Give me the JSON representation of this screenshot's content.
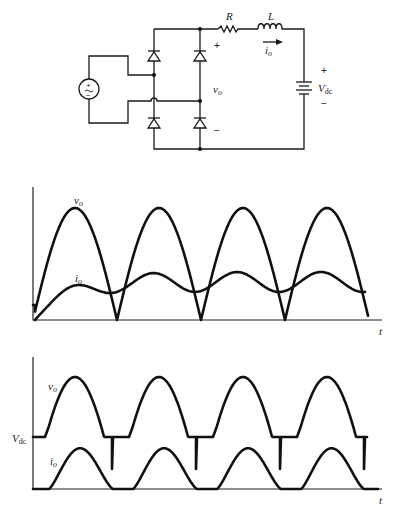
{
  "circuit": {
    "title": "Full-wave bridge rectifier with RL-source load",
    "source": {
      "symbol": "ac-voltage-source",
      "plus": "+",
      "minus": "−"
    },
    "resistor_label": "R",
    "inductor_label": "L",
    "current_label": "i",
    "current_sub": "o",
    "output_voltage_label": "v",
    "output_voltage_sub": "o",
    "output_plus": "+",
    "output_minus": "−",
    "battery_label": "V",
    "battery_sub": "dc",
    "battery_plus": "+",
    "battery_minus": "−"
  },
  "chart_data": [
    {
      "type": "line",
      "title": "Continuous-current operation",
      "xlabel": "t",
      "ylabel": "",
      "grid": false,
      "series": [
        {
          "name": "v_o",
          "label": "v",
          "sub": "o",
          "shape": "full-wave rectified sine, 4 half-cycles",
          "peak_positions": [
            75,
            160,
            244,
            327
          ],
          "zero_positions": [
            117,
            201,
            285,
            368
          ]
        },
        {
          "name": "i_o",
          "label": "i",
          "sub": "o",
          "shape": "rises from 0, then continuous ripple around mean",
          "peaks": [
            [
              97,
              277
            ],
            [
              174,
              273
            ],
            [
              258,
              273
            ],
            [
              342,
              273
            ]
          ],
          "troughs": [
            [
              127,
              293
            ],
            [
              210,
              292
            ],
            [
              294,
              292
            ]
          ]
        }
      ]
    },
    {
      "type": "line",
      "title": "Discontinuous-current operation",
      "xlabel": "t",
      "ylabel": "",
      "y_level_label": "V",
      "y_level_sub": "dc",
      "grid": false,
      "series": [
        {
          "name": "v_o",
          "label": "v",
          "sub": "o",
          "shape": "equals Vdc when io=0, follows rectified sine when conducting",
          "peak_positions": [
            75,
            159,
            243,
            327
          ]
        },
        {
          "name": "i_o",
          "label": "i",
          "sub": "o",
          "shape": "discontinuous pulses",
          "pulses": [
            [
              49,
              113
            ],
            [
              133,
              197
            ],
            [
              217,
              281
            ],
            [
              301,
              364
            ]
          ]
        }
      ]
    }
  ],
  "plots": {
    "top": {
      "t_label": "t",
      "vo_label": "v",
      "vo_sub": "o",
      "io_label": "i",
      "io_sub": "o"
    },
    "bottom": {
      "t_label": "t",
      "vo_label": "v",
      "vo_sub": "o",
      "io_label": "i",
      "io_sub": "o",
      "vdc_label": "V",
      "vdc_sub": "dc"
    }
  }
}
